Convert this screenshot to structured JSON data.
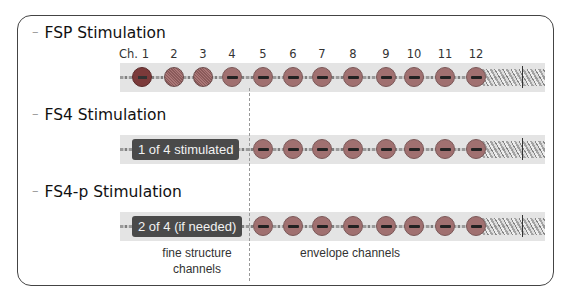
{
  "sections": [
    {
      "title": "FSP Stimulation",
      "badge": null
    },
    {
      "title": "FS4 Stimulation",
      "badge": "1 of 4 stimulated"
    },
    {
      "title": "FS4-p Stimulation",
      "badge": "2 of 4 (if needed)"
    }
  ],
  "channels": [
    "Ch. 1",
    "2",
    "3",
    "4",
    "5",
    "6",
    "7",
    "8",
    "9",
    "10",
    "11",
    "12"
  ],
  "channel_x": [
    142,
    174,
    203,
    232,
    263,
    293,
    322,
    353,
    386,
    414,
    445,
    476
  ],
  "fsp_electrode_types": [
    "fs1",
    "fs",
    "fs",
    "env",
    "env",
    "env",
    "env",
    "env",
    "env",
    "env",
    "env",
    "env"
  ],
  "labels": {
    "fine_structure": "fine structure\nchannels",
    "envelope": "envelope channels"
  },
  "colors": {
    "electrode_envelope": "#a07070",
    "electrode_active": "#7b3a3a",
    "badge_bg": "#4a4a4a",
    "strip_bg": "#e4e4e4"
  }
}
